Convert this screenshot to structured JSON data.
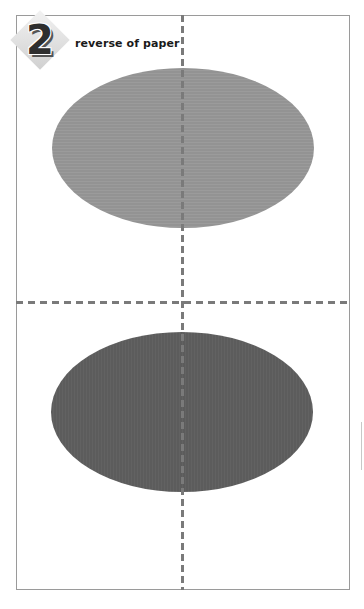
{
  "step": {
    "number": "2",
    "caption": "reverse of paper"
  },
  "diagram": {
    "shapes": [
      {
        "type": "ellipse",
        "position": "top",
        "color": "#949494"
      },
      {
        "type": "ellipse",
        "position": "bottom",
        "color": "#5e5e5e"
      }
    ],
    "fold_lines": [
      {
        "orientation": "vertical",
        "style": "dashed",
        "color": "#7a7a7a"
      },
      {
        "orientation": "horizontal",
        "style": "dashed",
        "color": "#7a7a7a"
      }
    ],
    "page_border_color": "#9a9a9a"
  }
}
